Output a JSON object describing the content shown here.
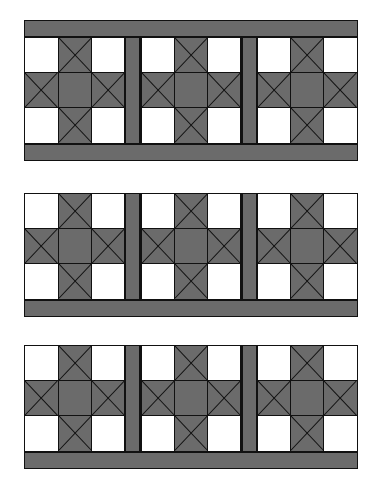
{
  "figure": {
    "background_color": "#ffffff",
    "fabric_dark": "#6b6b6b",
    "fabric_light": "#ffffff",
    "seam_line_color": "#111111"
  },
  "block_template": {
    "name": "ohio-star",
    "grid": "3x3",
    "cells": [
      {
        "position": "top-left",
        "kind": "plain",
        "fill": "light"
      },
      {
        "position": "top-center",
        "kind": "hourglass",
        "dark_sides": "left-right"
      },
      {
        "position": "top-right",
        "kind": "plain",
        "fill": "light"
      },
      {
        "position": "middle-left",
        "kind": "hourglass",
        "dark_sides": "top-bottom"
      },
      {
        "position": "center",
        "kind": "plain",
        "fill": "dark"
      },
      {
        "position": "middle-right",
        "kind": "hourglass",
        "dark_sides": "top-bottom"
      },
      {
        "position": "bottom-left",
        "kind": "plain",
        "fill": "light"
      },
      {
        "position": "bottom-center",
        "kind": "hourglass",
        "dark_sides": "left-right"
      },
      {
        "position": "bottom-right",
        "kind": "plain",
        "fill": "light"
      }
    ]
  },
  "panels": [
    {
      "id": "panel-1",
      "label": "Quilt row 1",
      "border_top": true,
      "border_bottom": true,
      "blocks": 3,
      "sashing_strips": 2
    },
    {
      "id": "panel-2",
      "label": "Quilt row 2",
      "border_top": false,
      "border_bottom": true,
      "blocks": 3,
      "sashing_strips": 2
    },
    {
      "id": "panel-3",
      "label": "Quilt row 3",
      "border_top": false,
      "border_bottom": true,
      "blocks": 3,
      "sashing_strips": 2
    }
  ]
}
